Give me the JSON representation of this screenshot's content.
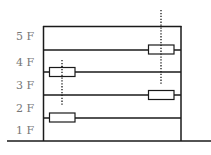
{
  "diagram": {
    "type": "building-cross-section",
    "floor_labels": [
      "5 F",
      "4 F",
      "3 F",
      "2 F",
      "1 F"
    ],
    "floor_label_positions_y": [
      36,
      62,
      85,
      108,
      130
    ],
    "colors": {
      "line": "#1a1a1a",
      "label": "#777777",
      "box_fill": "#ffffff"
    },
    "building": {
      "left": 43,
      "right": 181,
      "roof_y": 26,
      "ground_y": 141
    },
    "ground": {
      "x1": 7,
      "x2": 211,
      "y": 141
    },
    "floor_slabs_y": [
      50,
      72,
      95,
      118
    ],
    "boxes": [
      {
        "name": "box-2f-left",
        "x": 49,
        "y": 113,
        "w": 26,
        "h": 9
      },
      {
        "name": "box-4f-left",
        "x": 49,
        "y": 67,
        "w": 26,
        "h": 9
      },
      {
        "name": "box-3f-right",
        "x": 148,
        "y": 90,
        "w": 26,
        "h": 9
      },
      {
        "name": "box-5f-right",
        "x": 148,
        "y": 45,
        "w": 26,
        "h": 9
      }
    ],
    "dotted_lines": [
      {
        "name": "dotted-line-left",
        "x": 62,
        "y1": 60,
        "y2": 106
      },
      {
        "name": "dotted-line-right",
        "x": 161,
        "y1": 10,
        "y2": 84
      }
    ]
  }
}
